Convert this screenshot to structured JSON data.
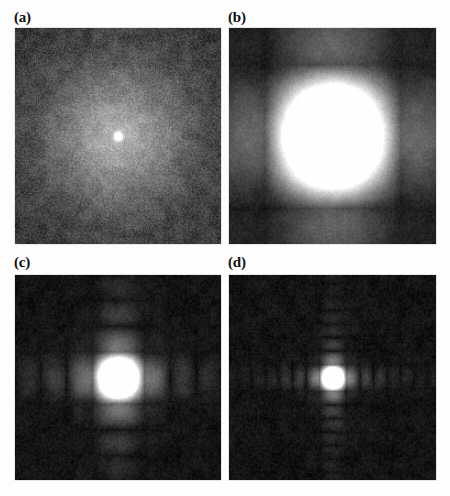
{
  "figure": {
    "background_color": "#fefefe",
    "label_color": "#101010",
    "panel_background_color": "#0a0a0a",
    "width": 450,
    "height": 496,
    "columns": 2,
    "rows": 2
  },
  "panels": [
    {
      "label": "(a)",
      "name": "panel-a",
      "x": 15,
      "y": 28,
      "label_x": 14,
      "label_y": 10,
      "width": 206,
      "height": 216,
      "pattern": "speckle-noise",
      "description": "Random speckle noise with faint diffuse bright core at center",
      "center_glow_radius": 42,
      "center_peak_intensity": 0.95,
      "background_level": 0.1,
      "noise_amplitude": 0.085,
      "noise_scale": 1.1,
      "lobe_period_x": 0,
      "lobe_period_y": 0,
      "orders_visible": 0
    },
    {
      "label": "(b)",
      "name": "panel-b",
      "x": 229,
      "y": 28,
      "label_x": 228,
      "label_y": 10,
      "width": 207,
      "height": 216,
      "pattern": "sinc-squared-2d",
      "description": "Broad sinc-squared diffraction pattern, wide central lobe with two side lobe orders",
      "center_peak_intensity": 1.0,
      "background_level": 0.07,
      "noise_amplitude": 0.035,
      "noise_scale": 1.6,
      "lobe_period_x": 68,
      "lobe_period_y": 72,
      "central_lobe_width": 70,
      "orders_visible": 2,
      "envelope_sigma": 150
    },
    {
      "label": "(c)",
      "name": "panel-c",
      "x": 15,
      "y": 275,
      "label_x": 14,
      "label_y": 255,
      "width": 206,
      "height": 205,
      "pattern": "sinc-squared-2d",
      "description": "Intermediate sinc-squared pattern, narrower central lobe with about four side lobe orders per axis",
      "center_peak_intensity": 1.0,
      "background_level": 0.06,
      "noise_amplitude": 0.035,
      "noise_scale": 1.6,
      "lobe_period_x": 26,
      "lobe_period_y": 26,
      "central_lobe_width": 30,
      "orders_visible": 4,
      "envelope_sigma": 95
    },
    {
      "label": "(d)",
      "name": "panel-d",
      "x": 229,
      "y": 275,
      "label_x": 228,
      "label_y": 255,
      "width": 207,
      "height": 205,
      "pattern": "sinc-squared-2d",
      "description": "Finest sinc-squared pattern, narrow central lobe with seven to eight side lobe orders per axis",
      "center_peak_intensity": 1.0,
      "background_level": 0.06,
      "noise_amplitude": 0.035,
      "noise_scale": 1.6,
      "lobe_period_x": 13.5,
      "lobe_period_y": 13.5,
      "central_lobe_width": 17,
      "orders_visible": 8,
      "envelope_sigma": 85
    }
  ],
  "chart_data": {
    "type": "heatmap",
    "title": "",
    "xlabel": "",
    "ylabel": "",
    "colormap": "grayscale",
    "value_range": [
      0,
      1
    ],
    "grid": false,
    "legend": "none",
    "subplots": [
      {
        "panel": "(a)",
        "type": "heatmap",
        "description": "Speckle / noise-dominated Fourier magnitude, diffuse central maximum",
        "profile_x_positions": [
          -100,
          -75,
          -50,
          -25,
          0,
          25,
          50,
          75,
          100
        ],
        "profile_x_values": [
          0.1,
          0.11,
          0.13,
          0.22,
          0.95,
          0.22,
          0.13,
          0.11,
          0.1
        ],
        "profile_y_positions": [
          -100,
          -75,
          -50,
          -25,
          0,
          25,
          50,
          75,
          100
        ],
        "profile_y_values": [
          0.1,
          0.11,
          0.13,
          0.22,
          0.95,
          0.22,
          0.13,
          0.11,
          0.1
        ],
        "lobe_period": 0,
        "orders": 0
      },
      {
        "panel": "(b)",
        "type": "heatmap",
        "description": "Wide sinc-squared lobes, lowest spatial frequency structure",
        "profile_x_positions": [
          -136,
          -102,
          -68,
          -34,
          0,
          34,
          68,
          102,
          136
        ],
        "profile_x_values": [
          0.1,
          0.02,
          0.28,
          0.05,
          1.0,
          0.05,
          0.28,
          0.02,
          0.1
        ],
        "profile_y_positions": [
          -144,
          -108,
          -72,
          -36,
          0,
          36,
          72,
          108,
          144
        ],
        "profile_y_values": [
          0.09,
          0.02,
          0.26,
          0.05,
          1.0,
          0.05,
          0.26,
          0.02,
          0.09
        ],
        "lobe_period": 68,
        "orders": 2
      },
      {
        "panel": "(c)",
        "type": "heatmap",
        "description": "Medium sinc-squared lobes, about four diffraction orders per side",
        "profile_x_positions": [
          -104,
          -78,
          -52,
          -26,
          0,
          26,
          52,
          78,
          104
        ],
        "profile_x_values": [
          0.13,
          0.17,
          0.24,
          0.38,
          1.0,
          0.38,
          0.24,
          0.17,
          0.13
        ],
        "profile_y_positions": [
          -104,
          -78,
          -52,
          -26,
          0,
          26,
          52,
          78,
          104
        ],
        "profile_y_values": [
          0.13,
          0.17,
          0.24,
          0.38,
          1.0,
          0.38,
          0.24,
          0.17,
          0.13
        ],
        "lobe_period": 26,
        "orders": 4
      },
      {
        "panel": "(d)",
        "type": "heatmap",
        "description": "Narrow sinc-squared lobes, seven to eight diffraction orders per side",
        "profile_x_positions": [
          -81,
          -67.5,
          -54,
          -40.5,
          -27,
          -13.5,
          0,
          13.5,
          27,
          40.5,
          54,
          67.5,
          81
        ],
        "profile_x_values": [
          0.13,
          0.15,
          0.18,
          0.22,
          0.28,
          0.4,
          1.0,
          0.4,
          0.28,
          0.22,
          0.18,
          0.15,
          0.13
        ],
        "profile_y_positions": [
          -81,
          -67.5,
          -54,
          -40.5,
          -27,
          -13.5,
          0,
          13.5,
          27,
          40.5,
          54,
          67.5,
          81
        ],
        "profile_y_values": [
          0.13,
          0.15,
          0.18,
          0.22,
          0.28,
          0.4,
          1.0,
          0.4,
          0.28,
          0.22,
          0.18,
          0.15,
          0.13
        ],
        "lobe_period": 13.5,
        "orders": 8
      }
    ]
  }
}
